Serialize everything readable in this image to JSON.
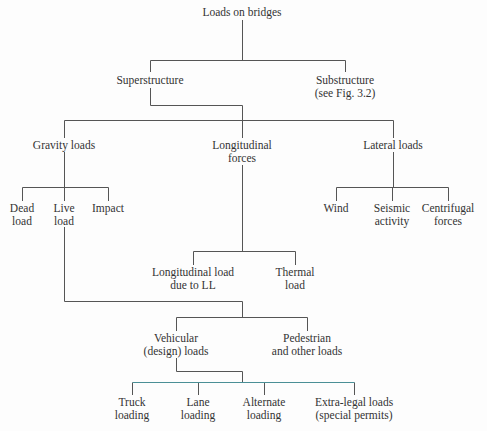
{
  "diagram": {
    "title": "Loads on bridges",
    "colors": {
      "line": "#555555",
      "accent_line": "#4a8f96",
      "text": "#333333"
    },
    "nodes": {
      "root": {
        "lines": [
          "Loads on bridges"
        ]
      },
      "superstructure": {
        "lines": [
          "Superstructure"
        ]
      },
      "substructure": {
        "lines": [
          "Substructure",
          "(see Fig. 3.2)"
        ]
      },
      "gravity": {
        "lines": [
          "Gravity loads"
        ]
      },
      "longitudinal": {
        "lines": [
          "Longitudinal",
          "forces"
        ]
      },
      "lateral": {
        "lines": [
          "Lateral loads"
        ]
      },
      "dead": {
        "lines": [
          "Dead",
          "load"
        ]
      },
      "live": {
        "lines": [
          "Live",
          "load"
        ]
      },
      "impact": {
        "lines": [
          "Impact"
        ]
      },
      "wind": {
        "lines": [
          "Wind"
        ]
      },
      "seismic": {
        "lines": [
          "Seismic",
          "activity"
        ]
      },
      "centrifugal": {
        "lines": [
          "Centrifugal",
          "forces"
        ]
      },
      "long_ll": {
        "lines": [
          "Longitudinal load",
          "due to LL"
        ]
      },
      "thermal": {
        "lines": [
          "Thermal",
          "load"
        ]
      },
      "vehicular": {
        "lines": [
          "Vehicular",
          "(design) loads"
        ]
      },
      "pedestrian": {
        "lines": [
          "Pedestrian",
          "and other loads"
        ]
      },
      "truck": {
        "lines": [
          "Truck",
          "loading"
        ]
      },
      "lane": {
        "lines": [
          "Lane",
          "loading"
        ]
      },
      "alternate": {
        "lines": [
          "Alternate",
          "loading"
        ]
      },
      "extra_legal": {
        "lines": [
          "Extra-legal loads",
          "(special permits)"
        ]
      }
    },
    "edges": [
      [
        "Loads on bridges",
        "Superstructure"
      ],
      [
        "Loads on bridges",
        "Substructure (see Fig. 3.2)"
      ],
      [
        "Superstructure",
        "Gravity loads"
      ],
      [
        "Superstructure",
        "Longitudinal forces"
      ],
      [
        "Superstructure",
        "Lateral loads"
      ],
      [
        "Gravity loads",
        "Dead load"
      ],
      [
        "Gravity loads",
        "Live load"
      ],
      [
        "Gravity loads",
        "Impact"
      ],
      [
        "Lateral loads",
        "Wind"
      ],
      [
        "Lateral loads",
        "Seismic activity"
      ],
      [
        "Lateral loads",
        "Centrifugal forces"
      ],
      [
        "Longitudinal forces",
        "Longitudinal load due to LL"
      ],
      [
        "Longitudinal forces",
        "Thermal load"
      ],
      [
        "Live load",
        "Vehicular (design) loads"
      ],
      [
        "Live load",
        "Pedestrian and other loads"
      ],
      [
        "Vehicular (design) loads",
        "Truck loading"
      ],
      [
        "Vehicular (design) loads",
        "Lane loading"
      ],
      [
        "Vehicular (design) loads",
        "Alternate loading"
      ],
      [
        "Vehicular (design) loads",
        "Extra-legal loads (special permits)"
      ]
    ]
  }
}
